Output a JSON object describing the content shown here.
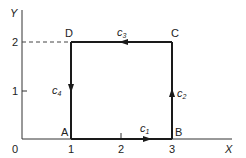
{
  "diagram": {
    "axes": {
      "x_label": "X",
      "y_label": "Y",
      "origin_label": "0",
      "x_ticks": [
        "1",
        "2",
        "3"
      ],
      "y_ticks": [
        "1",
        "2"
      ]
    },
    "points": [
      {
        "name": "A",
        "x": 1,
        "y": 0
      },
      {
        "name": "B",
        "x": 3,
        "y": 0
      },
      {
        "name": "C",
        "x": 3,
        "y": 2
      },
      {
        "name": "D",
        "x": 1,
        "y": 2
      }
    ],
    "curves": [
      {
        "label": "c",
        "sub": "1",
        "from": "A",
        "to": "B"
      },
      {
        "label": "c",
        "sub": "2",
        "from": "B",
        "to": "C"
      },
      {
        "label": "c",
        "sub": "3",
        "from": "C",
        "to": "D"
      },
      {
        "label": "c",
        "sub": "4",
        "from": "D",
        "to": "A"
      }
    ],
    "colors": {
      "line": "#1a1a1a",
      "background": "#ffffff"
    }
  }
}
